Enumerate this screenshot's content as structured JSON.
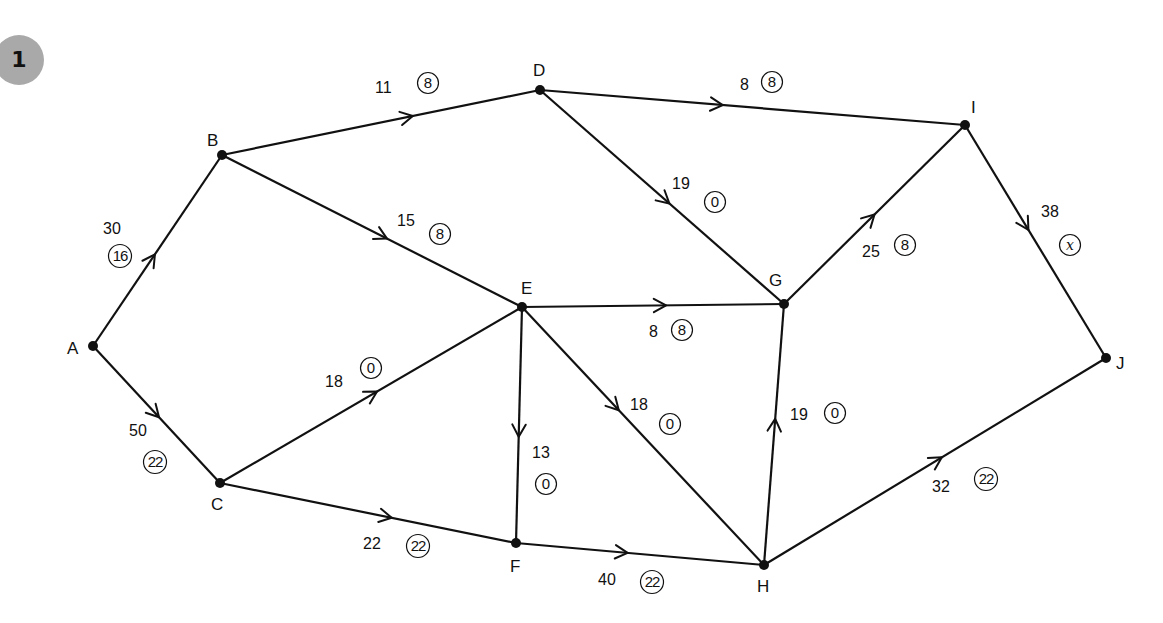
{
  "figure": {
    "number": "1",
    "badge_color": "#a9a9a9",
    "type": "flow-network"
  },
  "nodes": [
    {
      "id": "A",
      "label": "A",
      "x": 93,
      "y": 346,
      "lx": 67,
      "ly": 354
    },
    {
      "id": "B",
      "label": "B",
      "x": 222,
      "y": 155,
      "lx": 207,
      "ly": 146
    },
    {
      "id": "C",
      "label": "C",
      "x": 220,
      "y": 483,
      "lx": 211,
      "ly": 510
    },
    {
      "id": "D",
      "label": "D",
      "x": 540,
      "y": 90,
      "lx": 533,
      "ly": 76
    },
    {
      "id": "E",
      "label": "E",
      "x": 522,
      "y": 307,
      "lx": 521,
      "ly": 294
    },
    {
      "id": "F",
      "label": "F",
      "x": 516,
      "y": 543,
      "lx": 510,
      "ly": 572
    },
    {
      "id": "G",
      "label": "G",
      "x": 784,
      "y": 304,
      "lx": 769,
      "ly": 286
    },
    {
      "id": "H",
      "label": "H",
      "x": 764,
      "y": 565,
      "lx": 757,
      "ly": 592
    },
    {
      "id": "I",
      "label": "I",
      "x": 965,
      "y": 125,
      "lx": 971,
      "ly": 113
    },
    {
      "id": "J",
      "label": "J",
      "x": 1106,
      "y": 358,
      "lx": 1116,
      "ly": 369
    }
  ],
  "edges": [
    {
      "from": "A",
      "to": "B",
      "capacity": "30",
      "flow": "16",
      "arrow_t": 0.48,
      "cap_x": 103,
      "cap_y": 234,
      "flow_x": 120,
      "flow_y": 256
    },
    {
      "from": "A",
      "to": "C",
      "capacity": "50",
      "flow": "22",
      "arrow_t": 0.52,
      "cap_x": 129,
      "cap_y": 436,
      "flow_x": 155,
      "flow_y": 462
    },
    {
      "from": "B",
      "to": "D",
      "capacity": "11",
      "flow": "8",
      "arrow_t": 0.6,
      "cap_x": 375,
      "cap_y": 93,
      "flow_x": 428,
      "flow_y": 83
    },
    {
      "from": "B",
      "to": "E",
      "capacity": "15",
      "flow": "8",
      "arrow_t": 0.55,
      "cap_x": 397,
      "cap_y": 226,
      "flow_x": 440,
      "flow_y": 234
    },
    {
      "from": "D",
      "to": "I",
      "capacity": "8",
      "flow": "8",
      "arrow_t": 0.43,
      "cap_x": 740,
      "cap_y": 90,
      "flow_x": 772,
      "flow_y": 82
    },
    {
      "from": "D",
      "to": "G",
      "capacity": "19",
      "flow": "0",
      "arrow_t": 0.53,
      "cap_x": 672,
      "cap_y": 189,
      "flow_x": 715,
      "flow_y": 202
    },
    {
      "from": "E",
      "to": "G",
      "capacity": "8",
      "flow": "8",
      "arrow_t": 0.55,
      "cap_x": 649,
      "cap_y": 337,
      "flow_x": 682,
      "flow_y": 330
    },
    {
      "from": "C",
      "to": "E",
      "capacity": "18",
      "flow": "0",
      "arrow_t": 0.52,
      "cap_x": 325,
      "cap_y": 387,
      "flow_x": 371,
      "flow_y": 368
    },
    {
      "from": "E",
      "to": "F",
      "capacity": "13",
      "flow": "0",
      "arrow_t": 0.55,
      "cap_x": 532,
      "cap_y": 458,
      "flow_x": 546,
      "flow_y": 484
    },
    {
      "from": "E",
      "to": "H",
      "capacity": "18",
      "flow": "0",
      "arrow_t": 0.4,
      "cap_x": 630,
      "cap_y": 410,
      "flow_x": 670,
      "flow_y": 424
    },
    {
      "from": "C",
      "to": "F",
      "capacity": "22",
      "flow": "22",
      "arrow_t": 0.58,
      "cap_x": 363,
      "cap_y": 549,
      "flow_x": 418,
      "flow_y": 546
    },
    {
      "from": "F",
      "to": "H",
      "capacity": "40",
      "flow": "22",
      "arrow_t": 0.45,
      "cap_x": 598,
      "cap_y": 585,
      "flow_x": 652,
      "flow_y": 582
    },
    {
      "from": "H",
      "to": "G",
      "capacity": "19",
      "flow": "0",
      "arrow_t": 0.56,
      "cap_x": 790,
      "cap_y": 420,
      "flow_x": 835,
      "flow_y": 413
    },
    {
      "from": "G",
      "to": "I",
      "capacity": "25",
      "flow": "8",
      "arrow_t": 0.5,
      "cap_x": 862,
      "cap_y": 257,
      "flow_x": 905,
      "flow_y": 245
    },
    {
      "from": "I",
      "to": "J",
      "capacity": "38",
      "flow": "x",
      "arrow_t": 0.45,
      "cap_x": 1041,
      "cap_y": 217,
      "flow_x": 1070,
      "flow_y": 245
    },
    {
      "from": "H",
      "to": "J",
      "capacity": "32",
      "flow": "22",
      "arrow_t": 0.52,
      "cap_x": 932,
      "cap_y": 492,
      "flow_x": 986,
      "flow_y": 479
    }
  ]
}
